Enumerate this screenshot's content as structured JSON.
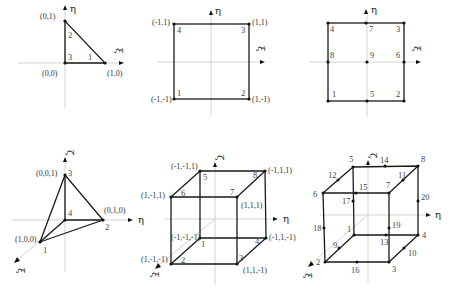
{
  "axes": {
    "xi": "ξ",
    "eta": "η",
    "zeta": "ζ"
  },
  "triangle3": {
    "coords": {
      "n1": "(1,0)",
      "n2": "(0,1)",
      "n3": "(0,0)"
    },
    "nodes": [
      "1",
      "2",
      "3"
    ]
  },
  "quad4": {
    "coords": {
      "n1": "(-1,-1)",
      "n2": "(1,-1)",
      "n3": "(1,1)",
      "n4": "(-1,1)"
    },
    "nodes": [
      "1",
      "2",
      "3",
      "4"
    ]
  },
  "quad9": {
    "nodes": [
      "1",
      "2",
      "3",
      "4",
      "5",
      "6",
      "7",
      "8",
      "9"
    ]
  },
  "tet4": {
    "coords": {
      "n1": "(1,0,0)",
      "n2": "(0,1,0)",
      "n3": "(0,0,1)"
    },
    "nodes": [
      "1",
      "2",
      "3",
      "4"
    ]
  },
  "hex8": {
    "coords": {
      "n1": "(-1,-1,-1)",
      "n2": "(1,-1,-1)",
      "n3": "(1,1,-1)",
      "n4": "(-1,1,-1)",
      "n5": "(-1,-1,1)",
      "n6": "(1,-1,1)",
      "n7": "(1,1,1)",
      "n8": "(-1,1,1)"
    },
    "nodes": [
      "1",
      "2",
      "3",
      "4",
      "5",
      "6",
      "7",
      "8"
    ]
  },
  "hex20": {
    "nodes": [
      "1",
      "2",
      "3",
      "4",
      "5",
      "6",
      "7",
      "8",
      "9",
      "10",
      "11",
      "12",
      "13",
      "14",
      "15",
      "16",
      "17",
      "18",
      "19",
      "20"
    ]
  }
}
